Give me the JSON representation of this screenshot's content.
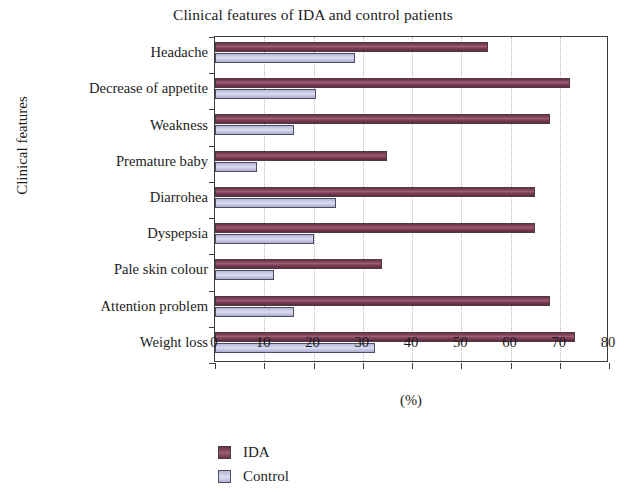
{
  "chart_data": {
    "type": "bar",
    "orientation": "horizontal",
    "title": "Clinical features of IDA and control patients",
    "xlabel": "(%)",
    "ylabel": "Clinical features",
    "xlim": [
      0,
      80
    ],
    "xticks": [
      0,
      10,
      20,
      30,
      40,
      50,
      60,
      70,
      80
    ],
    "xtick_labels": [
      "0",
      "10",
      "20",
      "30",
      "40",
      "50",
      "60",
      "70",
      "80"
    ],
    "grid": "vertical-dotted",
    "legend_position": "bottom-center",
    "categories": [
      "Headache",
      "Decrease of appetite",
      "Weakness",
      "Premature baby",
      "Diarrohea",
      "Dyspepsia",
      "Pale skin colour",
      "Attention problem",
      "Weight loss"
    ],
    "series": [
      {
        "name": "IDA",
        "color": "#7a3a52",
        "values": [
          55.5,
          72.0,
          68.0,
          35.0,
          65.0,
          65.0,
          34.0,
          68.0,
          73.0
        ]
      },
      {
        "name": "Control",
        "color": "#c8c8e4",
        "values": [
          28.5,
          20.5,
          16.0,
          8.5,
          24.5,
          20.0,
          12.0,
          16.0,
          32.5
        ]
      }
    ]
  },
  "legend": {
    "items": [
      {
        "label": "IDA"
      },
      {
        "label": "Control"
      }
    ]
  }
}
